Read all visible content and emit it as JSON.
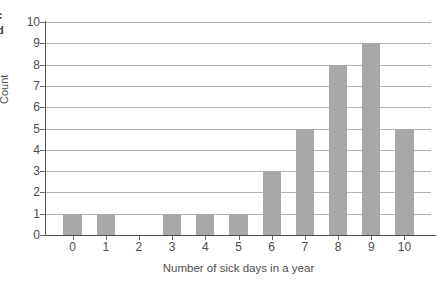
{
  "edge_artifacts": {
    "fragment_top": "c",
    "fragment_bottom": "d"
  },
  "chart_data": {
    "type": "bar",
    "title": "",
    "xlabel": "Number of sick days in a year",
    "ylabel": "Count",
    "categories": [
      "0",
      "1",
      "2",
      "3",
      "4",
      "5",
      "6",
      "7",
      "8",
      "9",
      "10"
    ],
    "values": [
      1,
      1,
      0,
      1,
      1,
      1,
      3,
      5,
      8,
      9,
      5
    ],
    "ylim": [
      0,
      10
    ],
    "yticks": [
      "0",
      "1",
      "2",
      "3",
      "4",
      "5",
      "6",
      "7",
      "8",
      "9",
      "10"
    ],
    "grid": true,
    "legend": "none",
    "bar_color": "#a8a8a8",
    "gridline_color": "#b4b4b4",
    "axis_color": "#4a4a4a",
    "background_color": "#ffffff"
  }
}
